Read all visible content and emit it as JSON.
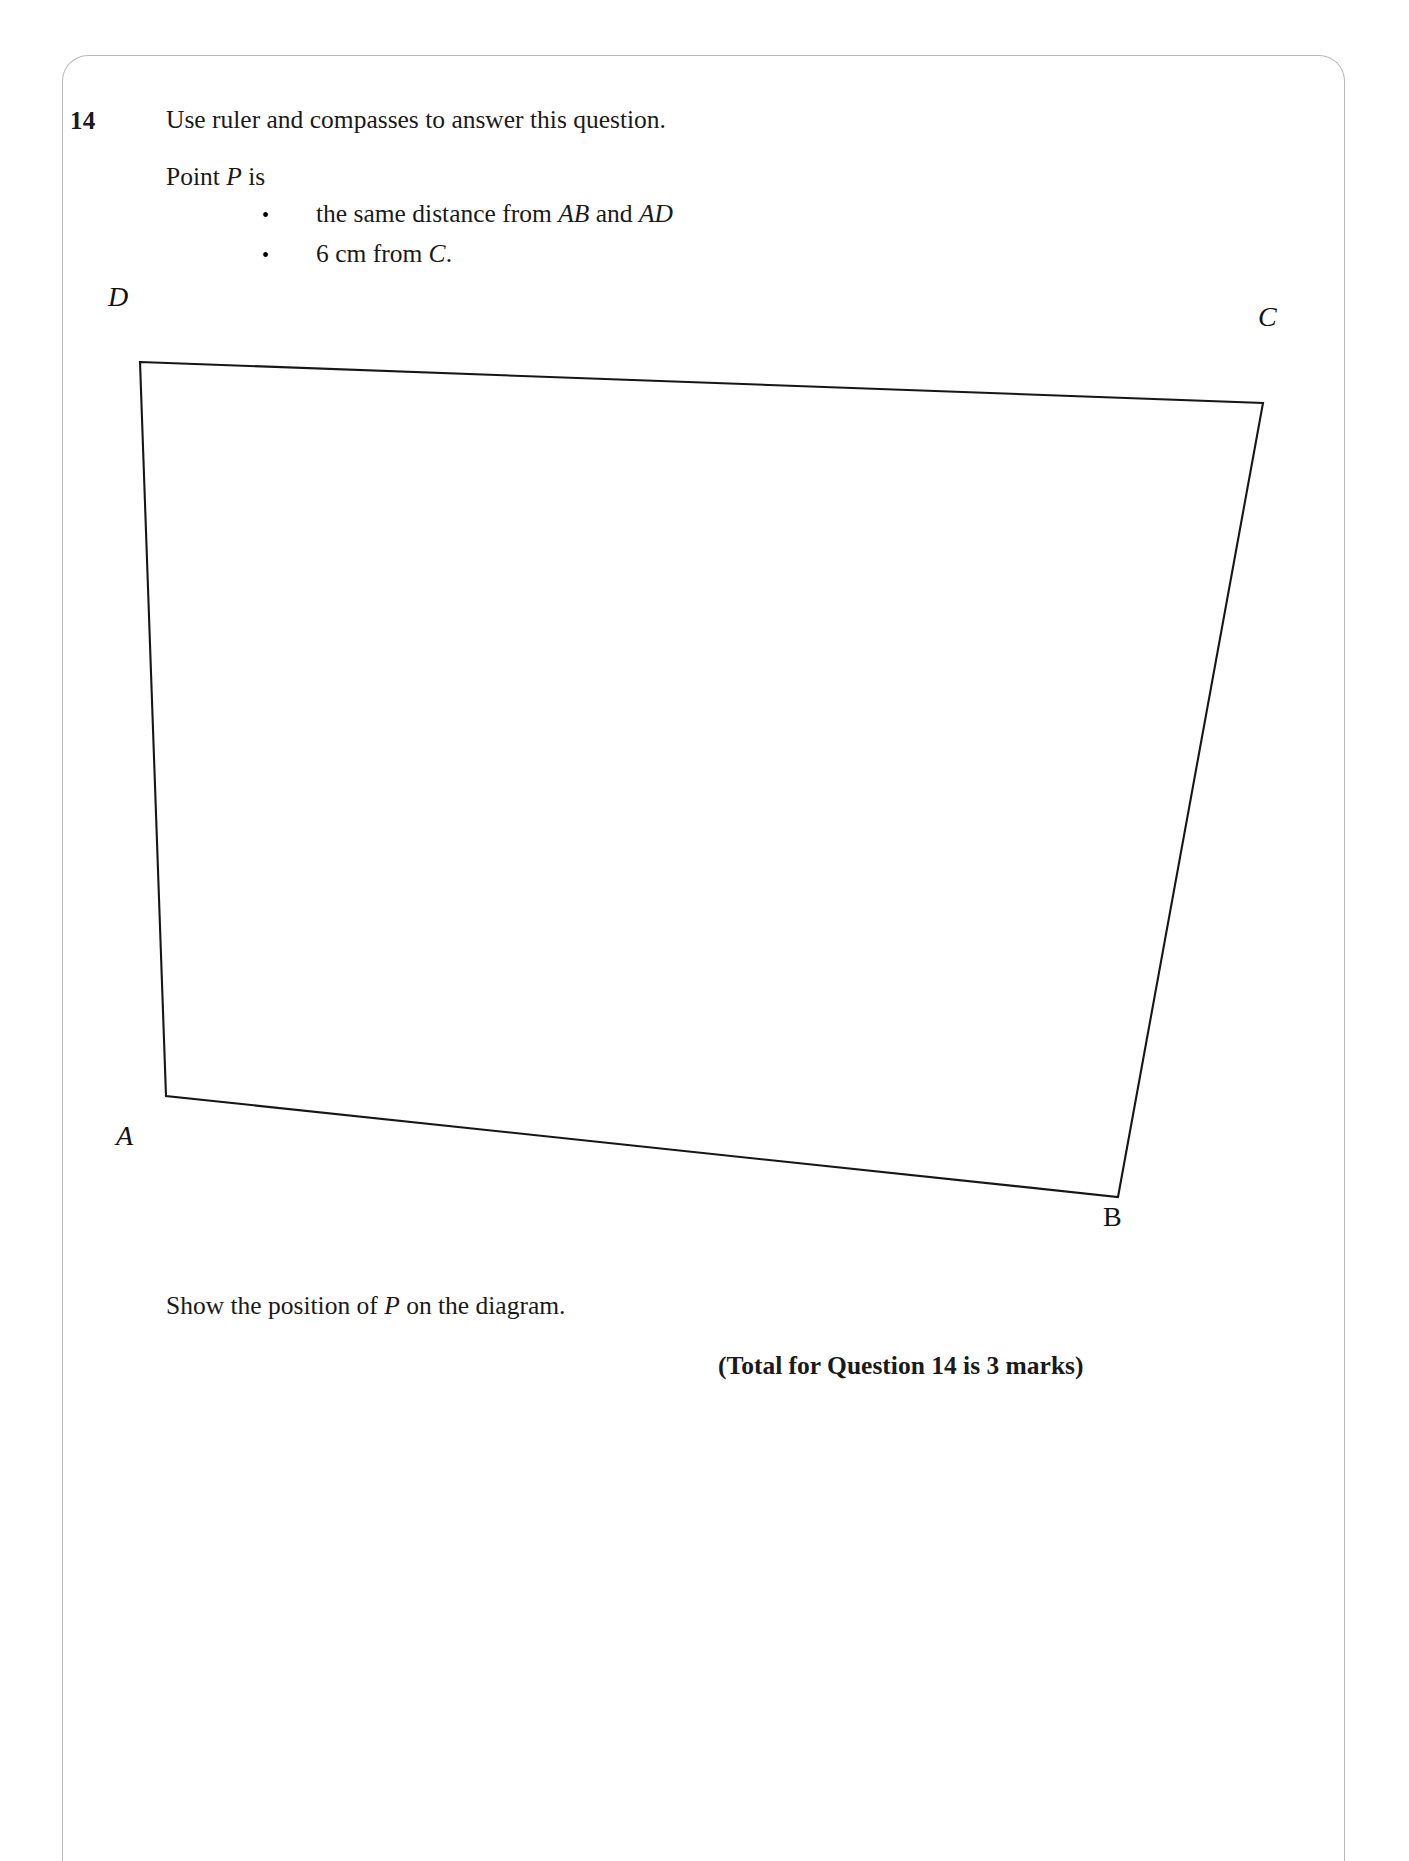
{
  "page": {
    "question_number": "14",
    "instruction": "Use ruler and compasses to answer this question.",
    "point_lead": "Point P is",
    "point_lead_plain": "Point ",
    "point_lead_italic": "P",
    "point_lead_tail": " is",
    "conditions": [
      {
        "bullet": "•",
        "text_before": "the same distance from ",
        "italic_1": "AB",
        "text_middle": " and ",
        "italic_2": "AD",
        "text_after": "",
        "full_text": "the same distance from AB and AD"
      },
      {
        "bullet": "•",
        "text_before": "6 cm from ",
        "italic_1": "C",
        "text_middle": "",
        "italic_2": "",
        "text_after": ".",
        "full_text": "6 cm from C."
      }
    ],
    "show_position": {
      "text_before": "Show the position of ",
      "italic_1": "P",
      "text_after": " on the diagram.",
      "full_text": "Show the position of P on the diagram."
    },
    "total_marks": "(Total for Question 14 is 3 marks)"
  },
  "diagram": {
    "shape": "quadrilateral",
    "vertices": [
      {
        "name": "A",
        "label": "A",
        "x": 166,
        "y": 1096,
        "label_style": "italic"
      },
      {
        "name": "B",
        "label": "B",
        "x": 1118,
        "y": 1197,
        "label_style": "upright"
      },
      {
        "name": "C",
        "label": "C",
        "x": 1263,
        "y": 403,
        "label_style": "italic"
      },
      {
        "name": "D",
        "label": "D",
        "x": 140,
        "y": 362,
        "label_style": "italic"
      }
    ],
    "path": "M 140 362 L 1263 403 L 1118 1197 L 166 1096 Z",
    "stroke_color": "#16161a"
  },
  "colors": {
    "ink": "#1a1a1a",
    "border": "#b9b9bd",
    "paper": "#ffffff"
  }
}
